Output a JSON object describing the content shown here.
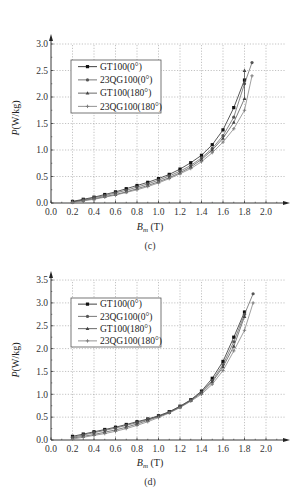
{
  "chart_data": [
    {
      "id": "c",
      "type": "line",
      "caption": "(c)",
      "title": "",
      "xlabel": "B_m (T)",
      "xlabel_main": "B",
      "xlabel_sub": "m",
      "xlabel_unit": " (T)",
      "ylabel": "P (W/kg)",
      "ylabel_main": "P",
      "ylabel_unit": "(W/kg)",
      "xlim": [
        0.0,
        2.0
      ],
      "ylim": [
        0.0,
        3.0
      ],
      "xticks": [
        "0.0",
        "0.2",
        "0.4",
        "0.6",
        "0.8",
        "1.0",
        "1.2",
        "1.4",
        "1.6",
        "1.8",
        "2.0"
      ],
      "yticks": [
        "0.0",
        "0.5",
        "1.0",
        "1.5",
        "2.0",
        "2.5",
        "3.0"
      ],
      "grid": true,
      "legend_position": "upper left",
      "x": [
        0.2,
        0.3,
        0.4,
        0.5,
        0.6,
        0.7,
        0.8,
        0.9,
        1.0,
        1.1,
        1.2,
        1.3,
        1.4,
        1.5,
        1.6,
        1.7,
        1.8
      ],
      "series": [
        {
          "name": "GT100(0°)",
          "marker": "square",
          "values": [
            0.03,
            0.07,
            0.11,
            0.16,
            0.21,
            0.27,
            0.33,
            0.39,
            0.46,
            0.54,
            0.64,
            0.76,
            0.9,
            1.1,
            1.38,
            1.8,
            2.32
          ],
          "extra": []
        },
        {
          "name": "23QG100(0°)",
          "marker": "circle",
          "values": [
            0.02,
            0.06,
            0.1,
            0.14,
            0.19,
            0.24,
            0.3,
            0.36,
            0.43,
            0.51,
            0.6,
            0.71,
            0.85,
            1.03,
            1.27,
            1.62,
            2.25
          ],
          "extra": [
            [
              1.87,
              2.65
            ]
          ]
        },
        {
          "name": "GT100(180°)",
          "marker": "triangle",
          "values": [
            0.02,
            0.05,
            0.08,
            0.12,
            0.16,
            0.21,
            0.27,
            0.33,
            0.4,
            0.48,
            0.57,
            0.68,
            0.82,
            1.0,
            1.22,
            1.52,
            1.97
          ],
          "extra": [
            [
              1.8,
              2.5
            ]
          ]
        },
        {
          "name": "23QG100(180°)",
          "marker": "cross",
          "values": [
            0.01,
            0.04,
            0.07,
            0.11,
            0.15,
            0.2,
            0.25,
            0.31,
            0.38,
            0.46,
            0.55,
            0.65,
            0.78,
            0.95,
            1.15,
            1.4,
            1.75
          ],
          "extra": [
            [
              1.87,
              2.4
            ]
          ]
        }
      ]
    },
    {
      "id": "d",
      "type": "line",
      "caption": "(d)",
      "title": "",
      "xlabel": "B_m (T)",
      "xlabel_main": "B",
      "xlabel_sub": "m",
      "xlabel_unit": " (T)",
      "ylabel": "P (W/kg)",
      "ylabel_main": "P",
      "ylabel_unit": "(W/kg)",
      "xlim": [
        0.0,
        2.0
      ],
      "ylim": [
        0.0,
        3.5
      ],
      "xticks": [
        "0.0",
        "0.2",
        "0.4",
        "0.6",
        "0.8",
        "1.0",
        "1.2",
        "1.4",
        "1.6",
        "1.8",
        "2.0"
      ],
      "yticks": [
        "0.0",
        "0.5",
        "1.0",
        "1.5",
        "2.0",
        "2.5",
        "3.0",
        "3.5"
      ],
      "grid": true,
      "legend_position": "upper left",
      "x": [
        0.2,
        0.3,
        0.4,
        0.5,
        0.6,
        0.7,
        0.8,
        0.9,
        1.0,
        1.1,
        1.2,
        1.3,
        1.4,
        1.5,
        1.6,
        1.7,
        1.8
      ],
      "series": [
        {
          "name": "GT100(0°)",
          "marker": "square",
          "values": [
            0.08,
            0.13,
            0.18,
            0.23,
            0.28,
            0.34,
            0.4,
            0.46,
            0.53,
            0.62,
            0.74,
            0.88,
            1.07,
            1.35,
            1.72,
            2.25,
            2.8
          ],
          "extra": []
        },
        {
          "name": "23QG100(0°)",
          "marker": "circle",
          "values": [
            0.06,
            0.11,
            0.16,
            0.21,
            0.26,
            0.32,
            0.38,
            0.45,
            0.52,
            0.61,
            0.73,
            0.87,
            1.05,
            1.3,
            1.65,
            2.15,
            2.75
          ],
          "extra": [
            [
              1.88,
              3.2
            ]
          ]
        },
        {
          "name": "GT100(180°)",
          "marker": "triangle",
          "values": [
            0.04,
            0.08,
            0.12,
            0.17,
            0.22,
            0.28,
            0.35,
            0.43,
            0.51,
            0.6,
            0.72,
            0.86,
            1.03,
            1.27,
            1.6,
            2.05,
            2.7
          ],
          "extra": []
        },
        {
          "name": "23QG100(180°)",
          "marker": "cross",
          "values": [
            0.02,
            0.06,
            0.1,
            0.14,
            0.19,
            0.25,
            0.32,
            0.4,
            0.49,
            0.59,
            0.71,
            0.85,
            1.0,
            1.22,
            1.52,
            1.95,
            2.4
          ],
          "extra": [
            [
              1.88,
              3.0
            ]
          ]
        }
      ]
    }
  ]
}
